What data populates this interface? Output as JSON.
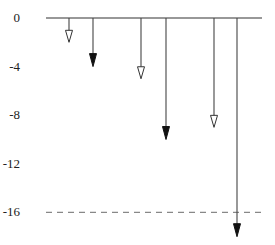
{
  "chart_data": {
    "type": "bar",
    "title": "",
    "xlabel": "",
    "ylabel": "",
    "ylim": [
      -18.5,
      0
    ],
    "y_ticks": [
      0,
      -4,
      -8,
      -12,
      -16
    ],
    "y_tick_labels": [
      "0",
      "-4",
      "-8",
      "-12",
      "-16"
    ],
    "reference_line": {
      "value": -16,
      "style": "dashed",
      "color": "#888888"
    },
    "arrows": [
      {
        "index": 1,
        "value": -2,
        "head": "open"
      },
      {
        "index": 2,
        "value": -4,
        "head": "filled"
      },
      {
        "index": 3,
        "value": -5,
        "head": "open"
      },
      {
        "index": 4,
        "value": -10,
        "head": "filled"
      },
      {
        "index": 5,
        "value": -9,
        "head": "open"
      },
      {
        "index": 6,
        "value": -18,
        "head": "filled"
      }
    ],
    "grid": false,
    "legend": "none"
  }
}
